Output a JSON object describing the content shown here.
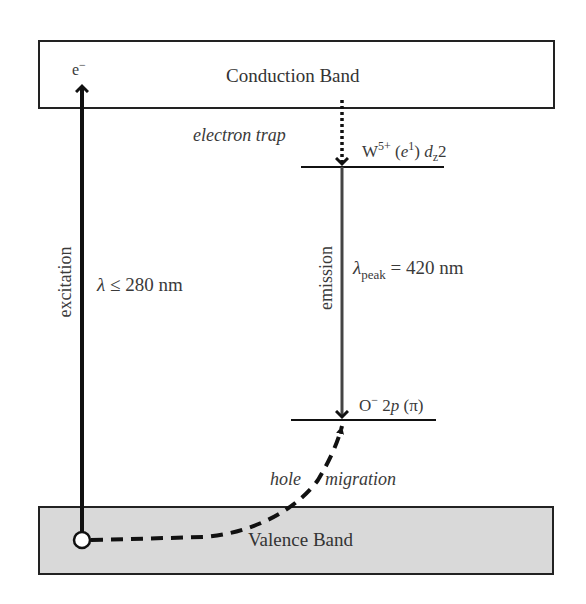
{
  "diagram": {
    "type": "energy-level-diagram",
    "bands": {
      "conduction": {
        "label": "Conduction Band",
        "fill": "#ffffff",
        "border": "#222222"
      },
      "valence": {
        "label": "Valence Band",
        "fill": "#d9d9d9",
        "border": "#222222"
      }
    },
    "electron_label": {
      "symbol": "e",
      "charge": "−"
    },
    "excitation": {
      "label": "excitation",
      "wavelength": {
        "symbol": "λ",
        "relation": "≤",
        "value": "280 nm"
      }
    },
    "electron_trap": {
      "label": "electron trap",
      "level": {
        "ion": "W",
        "charge": "5+",
        "config_open": "(",
        "config_e": "e",
        "config_exp": "1",
        "config_close": ")",
        "orbital": "d",
        "orbital_sub": "z",
        "orbital_tail": "2"
      }
    },
    "emission": {
      "label": "emission",
      "wavelength": {
        "symbol": "λ",
        "subscript": "peak",
        "equals": "=",
        "value": "420 nm"
      }
    },
    "hole_level": {
      "ion": "O",
      "charge": "−",
      "orbital": "2",
      "orbital_p": "p",
      "orbital_pi": "(π)"
    },
    "hole_migration": {
      "word1": "hole",
      "word2": "migration"
    },
    "colors": {
      "line": "#111111",
      "emission_line": "#444444",
      "text": "#333333",
      "valence_fill": "#d9d9d9"
    }
  }
}
